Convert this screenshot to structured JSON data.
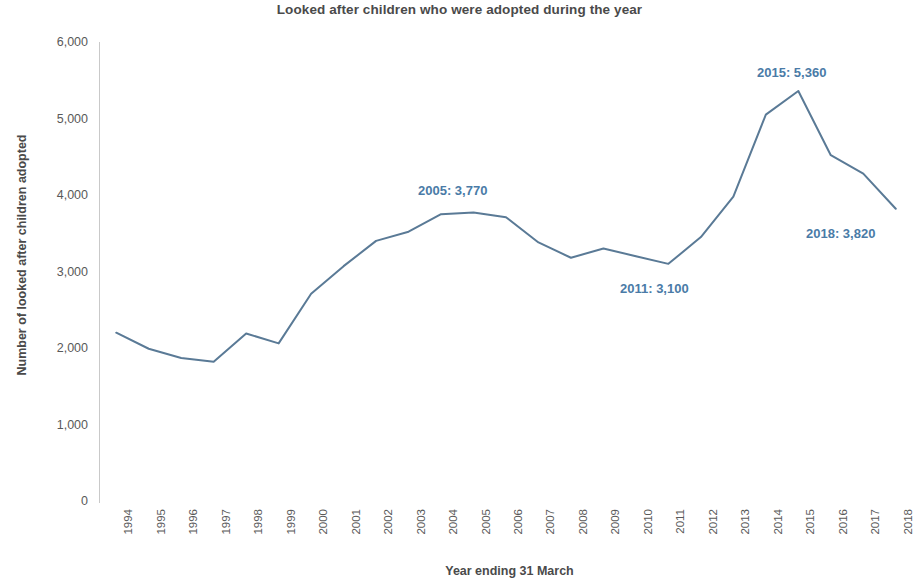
{
  "chart_data": {
    "type": "line",
    "title": "Looked after children who were adopted during the year",
    "xlabel": "Year ending 31 March",
    "ylabel": "Number of looked after children adopted",
    "grid": false,
    "legend": false,
    "line_color": "#5a7a96",
    "annotation_color": "#4a7ba7",
    "ylim": [
      0,
      6000
    ],
    "ytick_labels": [
      "6,000",
      "5,000",
      "4,000",
      "3,000",
      "2,000",
      "1,000",
      "0"
    ],
    "ytick_values": [
      6000,
      5000,
      4000,
      3000,
      2000,
      1000,
      0
    ],
    "categories": [
      "1994",
      "1995",
      "1996",
      "1997",
      "1998",
      "1999",
      "2000",
      "2001",
      "2002",
      "2003",
      "2004",
      "2005",
      "2006",
      "2007",
      "2008",
      "2009",
      "2010",
      "2011",
      "2012",
      "2013",
      "2014",
      "2015",
      "2016",
      "2017",
      "2018"
    ],
    "values": [
      2200,
      1990,
      1870,
      1820,
      2190,
      2060,
      2710,
      3070,
      3400,
      3520,
      3750,
      3770,
      3710,
      3380,
      3180,
      3300,
      3200,
      3100,
      3450,
      3980,
      5050,
      5360,
      4520,
      4280,
      3820
    ],
    "annotations": [
      {
        "id": "2005",
        "text": "2005: 3,770",
        "year": "2005",
        "value": 3770,
        "left": 418,
        "top": 183
      },
      {
        "id": "2015",
        "text": "2015: 5,360",
        "year": "2015",
        "value": 5360,
        "left": 757,
        "top": 65
      },
      {
        "id": "2011",
        "text": "2011: 3,100",
        "year": "2011",
        "value": 3100,
        "left": 620,
        "top": 281
      },
      {
        "id": "2018",
        "text": "2018: 3,820",
        "year": "2018",
        "value": 3820,
        "left": 806,
        "top": 226
      }
    ]
  }
}
